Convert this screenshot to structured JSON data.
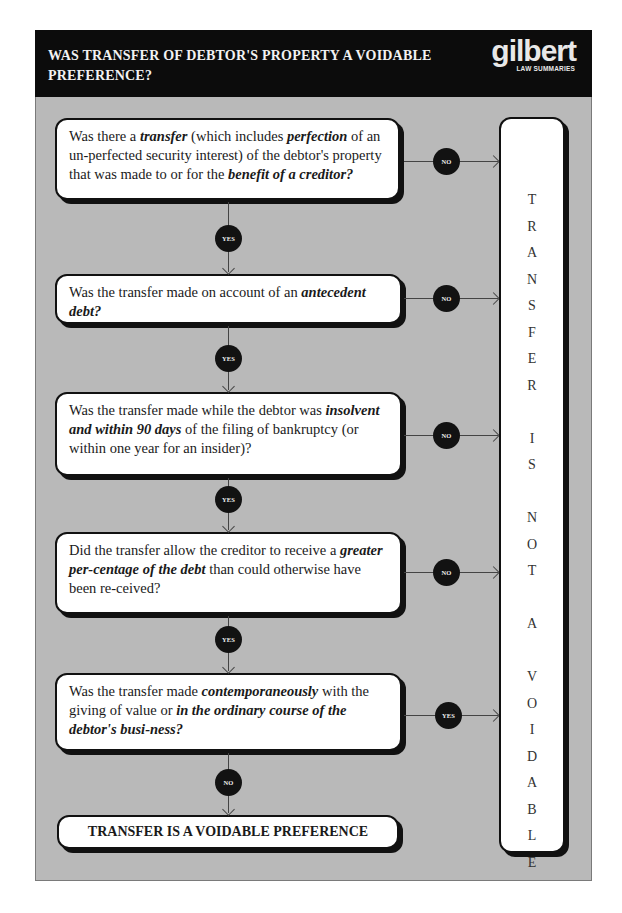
{
  "header": {
    "title": "WAS TRANSFER OF DEBTOR'S PROPERTY A VOIDABLE PREFERENCE?",
    "logo": {
      "word": "gilbert",
      "sub": "LAW SUMMARIES"
    }
  },
  "colors": {
    "frame_bg": "#b9b9b9",
    "header_bg": "#0c0c0c",
    "box_bg": "#ffffff",
    "badge_bg": "#121212"
  },
  "questions": [
    {
      "segments": [
        {
          "t": "Was there a "
        },
        {
          "t": "transfer",
          "em": true
        },
        {
          "t": " (which includes "
        },
        {
          "t": "perfection",
          "em": true
        },
        {
          "t": " of an un-perfected security interest) of the debtor's property that was made to or for the "
        },
        {
          "t": "benefit of a creditor?",
          "em": true
        }
      ],
      "text": "Was there a transfer (which includes perfection of an un-perfected security interest) of the debtor's property that was made to or for the benefit of a creditor?",
      "side_label": "NO",
      "down_label": "YES"
    },
    {
      "segments": [
        {
          "t": "Was the transfer made on account of an "
        },
        {
          "t": "antecedent debt?",
          "em": true
        }
      ],
      "text": "Was the transfer made on account of an antecedent debt?",
      "side_label": "NO",
      "down_label": "YES"
    },
    {
      "segments": [
        {
          "t": "Was the transfer made while the debtor was "
        },
        {
          "t": "insolvent and within 90 days",
          "em": true
        },
        {
          "t": " of the filing of bankruptcy (or within one year for an insider)?"
        }
      ],
      "text": "Was the transfer made while the debtor was insolvent and within 90 days of the filing of bankruptcy (or within one year for an insider)?",
      "side_label": "NO",
      "down_label": "YES"
    },
    {
      "segments": [
        {
          "t": "Did the transfer allow the creditor to receive a "
        },
        {
          "t": "greater per-centage of the debt",
          "em": true
        },
        {
          "t": " than could otherwise have been re-ceived?"
        }
      ],
      "text": "Did the transfer allow the creditor to receive a greater percentage of the debt than could otherwise have been received?",
      "side_label": "NO",
      "down_label": "YES"
    },
    {
      "segments": [
        {
          "t": "Was the transfer made "
        },
        {
          "t": "contemporaneously",
          "em": true
        },
        {
          "t": " with the giving of value or "
        },
        {
          "t": "in the ordinary course of the debtor's busi-ness?",
          "em": true
        }
      ],
      "text": "Was the transfer made contemporaneously with the giving of value or in the ordinary course of the debtor's business?",
      "side_label": "YES",
      "down_label": "NO"
    }
  ],
  "final_box": "TRANSFER IS A VOIDABLE PREFERENCE",
  "side_box": {
    "text": "TRANSFER IS NOT A VOIDABLE",
    "letters": [
      "T",
      "R",
      "A",
      "N",
      "S",
      "F",
      "E",
      "R",
      "",
      "I",
      "S",
      "",
      "N",
      "O",
      "T",
      "",
      "A",
      "",
      "V",
      "O",
      "I",
      "D",
      "A",
      "B",
      "L",
      "E"
    ]
  }
}
